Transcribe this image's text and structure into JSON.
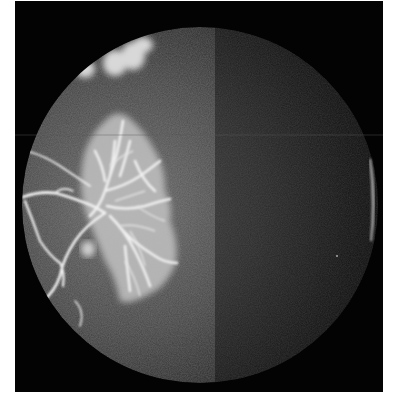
{
  "image": {
    "subject": "fluorescein angiogram of retina",
    "background_color": "#ffffff",
    "frame_color": "#030303",
    "fundus_circle": {
      "cx": 185,
      "cy": 204,
      "r": 178
    },
    "fundus_base_color": "#3a3a3a",
    "hyperfluorescence_color": "#e8e8e8",
    "regions": [
      {
        "name": "upper-leakage-patches",
        "description": "bright fluffy hyperfluorescent patches near top-left of fundus"
      },
      {
        "name": "neovascular-frond",
        "description": "large branching hyperfluorescent vascular network on left side"
      },
      {
        "name": "retinal-vessels",
        "description": "bright branching vessels entering from left edge"
      },
      {
        "name": "reflex-crescent",
        "description": "thin bright crescent artifact at right edge"
      },
      {
        "name": "scan-line-artifact",
        "description": "faint horizontal line across image"
      }
    ]
  }
}
